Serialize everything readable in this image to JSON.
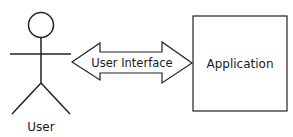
{
  "diagram": {
    "actor": {
      "label": "User"
    },
    "connector": {
      "label": "User Interface",
      "type": "double-headed-arrow"
    },
    "system": {
      "label": "Application"
    }
  },
  "colors": {
    "stroke": "#222222",
    "text": "#1a1a1a",
    "background": "#ffffff"
  }
}
